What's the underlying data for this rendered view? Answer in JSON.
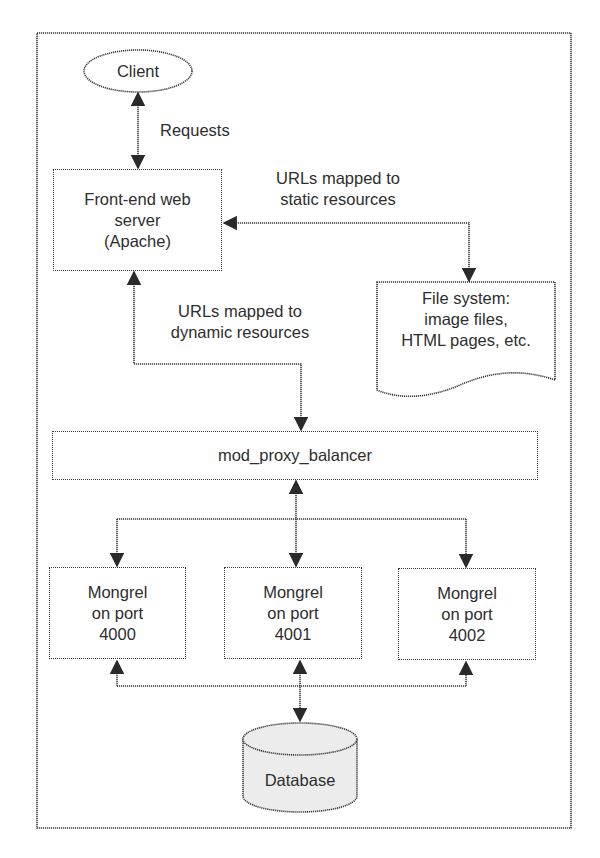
{
  "diagram": {
    "client": {
      "label": "Client"
    },
    "edge_requests": {
      "label": "Requests"
    },
    "frontend": {
      "lines": [
        "Front-end web",
        "server",
        "(Apache)"
      ]
    },
    "edge_static": {
      "lines": [
        "URLs mapped to",
        "static resources"
      ]
    },
    "filesystem": {
      "lines": [
        "File system:",
        "image files,",
        "HTML pages, etc."
      ]
    },
    "edge_dynamic": {
      "lines": [
        "URLs mapped to",
        "dynamic resources"
      ]
    },
    "proxy": {
      "label": "mod_proxy_balancer"
    },
    "mongrels": [
      {
        "lines": [
          "Mongrel",
          "on port",
          "4000"
        ]
      },
      {
        "lines": [
          "Mongrel",
          "on port",
          "4001"
        ]
      },
      {
        "lines": [
          "Mongrel",
          "on port",
          "4002"
        ]
      }
    ],
    "database": {
      "label": "Database"
    },
    "colors": {
      "stroke": "#3a3a3a",
      "db_fill": "#ececec",
      "background": "#ffffff"
    }
  }
}
